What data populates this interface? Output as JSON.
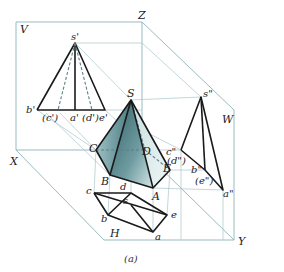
{
  "diagram": {
    "caption": "(a)",
    "planes": {
      "V": "V",
      "H": "H",
      "W": "W"
    },
    "axes": {
      "X": "X",
      "Y": "Y",
      "Z": "Z"
    },
    "solid": {
      "type": "pentagonal pyramid",
      "apex": "S",
      "base_vertices": [
        "A",
        "B",
        "C",
        "D",
        "E"
      ]
    },
    "front_view_labels": {
      "apex": "s'",
      "b": "b'",
      "c": "(c')",
      "a": "a'",
      "d": "(d')",
      "e": "e'"
    },
    "top_view_labels": {
      "apex": "s",
      "a": "a",
      "b": "b",
      "c": "c",
      "d": "d",
      "e": "e"
    },
    "side_view_labels": {
      "apex": "s\"",
      "c": "c\"",
      "d": "(d\")",
      "b": "b\"",
      "e": "(e\")",
      "a": "a\""
    },
    "colors": {
      "frame": "#8fb3b8",
      "projection_lines": "#a9c6ca",
      "edges": "#1a1a1a",
      "solid_fill_dark": "#3f7078",
      "solid_fill_light": "#dbe9ea"
    }
  }
}
